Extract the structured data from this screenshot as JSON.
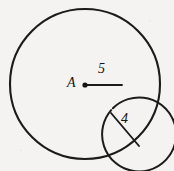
{
  "figure": {
    "type": "geometry-diagram",
    "background_color": "#f4f3f1",
    "stroke_color": "#1b1b1b",
    "labels": {
      "center_point": "A",
      "inner_radius_value": "5",
      "annulus_segment_value": "4"
    },
    "geometry": {
      "center": {
        "x": 85,
        "y": 84
      },
      "outer_circle": {
        "cx": 85,
        "cy": 84,
        "r": 75
      },
      "inner_circle": {
        "cx": 85,
        "cy": 84,
        "r": 37
      },
      "radius_line": {
        "x1": 85,
        "y1": 85,
        "x2": 122,
        "y2": 85
      },
      "annulus_segment": {
        "x1": 111,
        "y1": 113,
        "x2": 139,
        "y2": 146
      },
      "center_dot_radius": 2.6
    }
  }
}
